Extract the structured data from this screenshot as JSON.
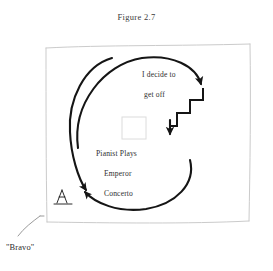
{
  "figure": {
    "caption": "Figure 2.7",
    "labels": {
      "decide": "I decide to",
      "get_off": "get off",
      "pianist_plays": "Pianist Plays",
      "emperor": "Emperor",
      "concerto": "Concerto",
      "bravo": "\"Bravo\""
    },
    "icons": {
      "frame": "sketched-rectangle-frame",
      "inner_square": "faint-square-outline",
      "audience_figure": "seated-listener-figure",
      "staircase": "descending-staircase-arrow",
      "upper_curve": "curved-arrow-clockwise-top",
      "left_curve": "curved-arrow-down-left",
      "lower_curve": "curved-arrow-leftward-bottom",
      "bravo_leader": "leader-line-pointer"
    },
    "colors": {
      "ink": "#1a1a1a",
      "text": "#2e2e2e",
      "frame": "#c9c9c9",
      "faint": "#d9d9d9",
      "background": "#ffffff"
    }
  }
}
